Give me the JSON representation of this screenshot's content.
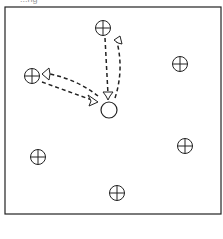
{
  "caption": "...ng",
  "arena": {
    "x": 5,
    "y": 7,
    "width": 216,
    "height": 207,
    "stroke": "#222222"
  },
  "home": {
    "name": "center-circle",
    "cx": 109,
    "cy": 110,
    "r": 8
  },
  "targets": [
    {
      "name": "target-top",
      "cx": 103,
      "cy": 28,
      "r": 7.5
    },
    {
      "name": "target-left",
      "cx": 32,
      "cy": 76,
      "r": 7.5
    },
    {
      "name": "target-upper-right",
      "cx": 180,
      "cy": 64,
      "r": 7.5
    },
    {
      "name": "target-lower-right",
      "cx": 185,
      "cy": 146,
      "r": 7.5
    },
    {
      "name": "target-lower-left",
      "cx": 38,
      "cy": 157,
      "r": 7.5
    },
    {
      "name": "target-bottom",
      "cx": 117,
      "cy": 193,
      "r": 7.5
    }
  ],
  "paths": [
    {
      "name": "path-top-to-center",
      "d": "M105 38 L108 94"
    },
    {
      "name": "path-center-to-top",
      "d": "M115 98 Q124 70 117 42"
    },
    {
      "name": "path-left-to-center",
      "d": "M42 82 L92 100"
    },
    {
      "name": "path-center-to-left",
      "d": "M98 96 Q78 80 50 74"
    }
  ]
}
